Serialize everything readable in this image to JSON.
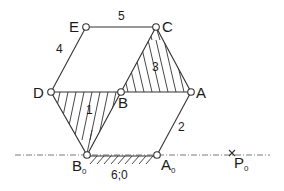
{
  "diagram": {
    "type": "planar linkage mechanism",
    "colors": {
      "line": "#333333",
      "background": "#ffffff"
    },
    "joints": {
      "E": {
        "label": "E",
        "x": 86,
        "y": 27
      },
      "C": {
        "label": "C",
        "x": 156,
        "y": 27
      },
      "D": {
        "label": "D",
        "x": 51,
        "y": 92
      },
      "B": {
        "label": "B",
        "x": 121,
        "y": 92
      },
      "A": {
        "label": "A",
        "x": 191,
        "y": 92
      },
      "B0": {
        "label": "B",
        "sub": "0",
        "x": 87,
        "y": 155
      },
      "A0": {
        "label": "A",
        "sub": "0",
        "x": 157,
        "y": 155
      }
    },
    "point_P0": {
      "label": "P",
      "sub": "0",
      "marker": "x",
      "x": 232,
      "y": 153
    },
    "links": [
      {
        "id": "1",
        "label": "1",
        "type": "ternary (D-B-B0)",
        "hatched": true
      },
      {
        "id": "2",
        "label": "2",
        "type": "binary (A-A0)"
      },
      {
        "id": "3",
        "label": "3",
        "type": "ternary (B-C-A)",
        "hatched": true
      },
      {
        "id": "4",
        "label": "4",
        "type": "binary (D-E)"
      },
      {
        "id": "5",
        "label": "5",
        "type": "binary (E-C)"
      }
    ],
    "ground": {
      "label": "6;0",
      "hatched": true
    },
    "axis_line": {
      "style": "dash-dot",
      "y": 155,
      "x_start": 15,
      "x_end": 270
    }
  }
}
